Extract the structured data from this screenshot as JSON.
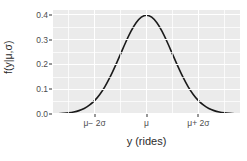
{
  "chart_data": {
    "type": "line",
    "title": "",
    "subtitle": "",
    "xlabel": "y (rides)",
    "ylabel": "f(y|μ,σ)",
    "distribution": "normal density",
    "xlim": [
      -3.6,
      3.6
    ],
    "ylim": [
      0.0,
      0.42
    ],
    "grid": true,
    "legend": null,
    "legend_position": "none",
    "panel_background": "#ebebeb",
    "grid_color": "#ffffff",
    "line_color": "#1a1a1a",
    "line_width": 1.6,
    "x_ticks": [
      {
        "value": -2,
        "label": "μ− 2σ"
      },
      {
        "value": 0,
        "label": "μ"
      },
      {
        "value": 2,
        "label": "μ+ 2σ"
      }
    ],
    "y_ticks": [
      {
        "value": 0.0,
        "label": "0.0"
      },
      {
        "value": 0.1,
        "label": "0.1"
      },
      {
        "value": 0.2,
        "label": "0.2"
      },
      {
        "value": 0.3,
        "label": "0.3"
      },
      {
        "value": 0.4,
        "label": "0.4"
      }
    ],
    "y_minor_ticks": [
      0.05,
      0.15,
      0.25,
      0.35
    ],
    "x_minor_ticks": [
      -3,
      -1,
      1,
      3
    ],
    "x": [
      -3.6,
      -3.4,
      -3.2,
      -3.0,
      -2.8,
      -2.6,
      -2.4,
      -2.2,
      -2.0,
      -1.8,
      -1.6,
      -1.4,
      -1.2,
      -1.0,
      -0.8,
      -0.6,
      -0.4,
      -0.2,
      0.0,
      0.2,
      0.4,
      0.6,
      0.8,
      1.0,
      1.2,
      1.4,
      1.6,
      1.8,
      2.0,
      2.2,
      2.4,
      2.6,
      2.8,
      3.0,
      3.2,
      3.4,
      3.6
    ],
    "y": [
      0.0006,
      0.0012,
      0.0024,
      0.0044,
      0.0079,
      0.0136,
      0.0224,
      0.0355,
      0.054,
      0.079,
      0.1109,
      0.1497,
      0.1942,
      0.242,
      0.2897,
      0.3332,
      0.3683,
      0.391,
      0.3989,
      0.391,
      0.3683,
      0.3332,
      0.2897,
      0.242,
      0.1942,
      0.1497,
      0.1109,
      0.079,
      0.054,
      0.0355,
      0.0224,
      0.0136,
      0.0079,
      0.0044,
      0.0024,
      0.0012,
      0.0006
    ],
    "peak": {
      "x": 0,
      "y": 0.3989,
      "label": "μ"
    },
    "annotations": []
  }
}
